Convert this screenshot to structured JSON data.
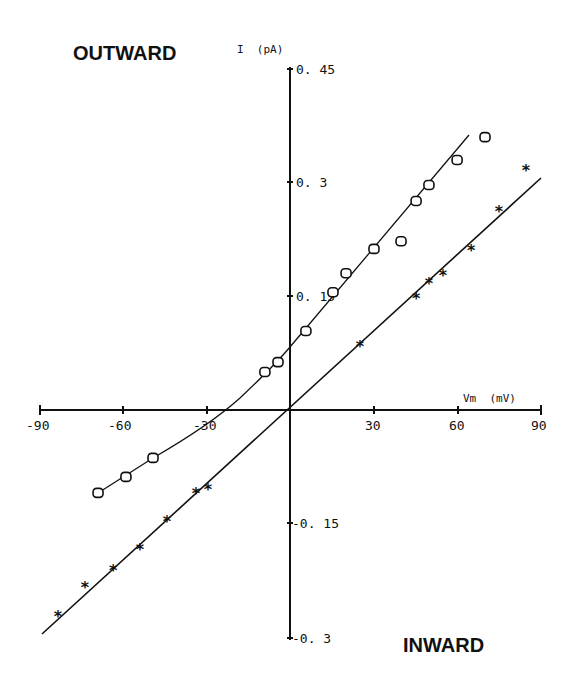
{
  "chart_data": {
    "type": "scatter",
    "title": "",
    "xlabel": "Vm (mV)",
    "ylabel": "I (pA)",
    "xlim": [
      -90,
      90
    ],
    "ylim": [
      -0.3,
      0.45
    ],
    "x_ticks": [
      "-90",
      "-60",
      "-30",
      "30",
      "60",
      "90"
    ],
    "y_ticks": [
      "0.45",
      "0.3",
      "0.15",
      "-0.15",
      "-0.3"
    ],
    "grid": false,
    "annotations": [
      "OUTWARD",
      "INWARD"
    ],
    "series": [
      {
        "name": "open circles",
        "marker": "circle",
        "points": [
          [
            -68.8,
            -0.109
          ],
          [
            -58.8,
            -0.088
          ],
          [
            -49.1,
            -0.063
          ],
          [
            -9.0,
            0.05
          ],
          [
            -4.3,
            0.063
          ],
          [
            5.7,
            0.104
          ],
          [
            15.4,
            0.155
          ],
          [
            20.1,
            0.18
          ],
          [
            30.1,
            0.212
          ],
          [
            39.8,
            0.222
          ],
          [
            45.2,
            0.275
          ],
          [
            49.8,
            0.296
          ],
          [
            59.9,
            0.329
          ],
          [
            69.9,
            0.359
          ]
        ],
        "fit": {
          "type": "curve",
          "reversal_mV": -24,
          "i_at_0mV": 0.083
        }
      },
      {
        "name": "asterisks",
        "marker": "star",
        "points": [
          [
            -83.2,
            -0.271
          ],
          [
            -73.5,
            -0.233
          ],
          [
            -63.4,
            -0.211
          ],
          [
            -53.8,
            -0.183
          ],
          [
            -44.1,
            -0.146
          ],
          [
            -33.7,
            -0.109
          ],
          [
            -29.4,
            -0.104
          ],
          [
            25.1,
            0.084
          ],
          [
            45.2,
            0.147
          ],
          [
            49.8,
            0.167
          ],
          [
            54.8,
            0.178
          ],
          [
            64.9,
            0.211
          ],
          [
            74.9,
            0.262
          ],
          [
            84.6,
            0.316
          ]
        ],
        "fit": {
          "type": "linear",
          "reversal_mV": 0,
          "slope_pA_per_mV": 0.0034
        }
      }
    ]
  },
  "labels": {
    "outward": "OUTWARD",
    "inward": "INWARD",
    "y_axis_title": "I  (pA)",
    "x_axis_title": "Vm  (mV)",
    "x_tick_m90": "-90",
    "x_tick_m60": "-60",
    "x_tick_m30": "-30",
    "x_tick_30": "30",
    "x_tick_60": "60",
    "x_tick_90": "90",
    "y_tick_045": "0. 45",
    "y_tick_03": "0. 3",
    "y_tick_015": "0. 15",
    "y_tick_m015": "-0. 15",
    "y_tick_m03": "-0. 3"
  }
}
